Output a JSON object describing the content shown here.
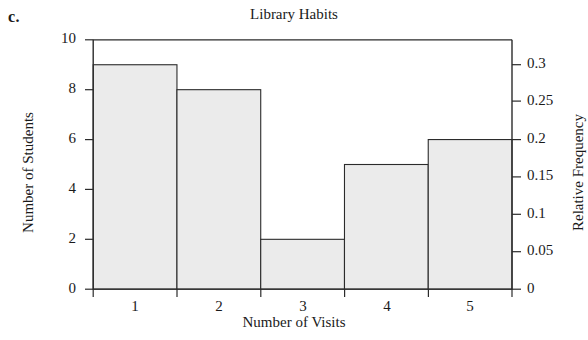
{
  "part_label": "c.",
  "chart_data": {
    "type": "bar",
    "title": "Library Habits",
    "xlabel": "Number of Visits",
    "ylabel": "Number of Students",
    "y2label": "Relative Frequency",
    "categories": [
      "1",
      "2",
      "3",
      "4",
      "5"
    ],
    "values": [
      9,
      8,
      2,
      5,
      6
    ],
    "relative_frequency": [
      0.3,
      0.2667,
      0.0667,
      0.1667,
      0.2
    ],
    "total": 30,
    "ylim": [
      0,
      10
    ],
    "yticks": [
      "0",
      "2",
      "4",
      "6",
      "8",
      "10"
    ],
    "ytick_values": [
      0,
      2,
      4,
      6,
      8,
      10
    ],
    "y2lim": [
      0,
      0.3333
    ],
    "y2ticks": [
      "0",
      "0.05",
      "0.1",
      "0.15",
      "0.2",
      "0.25",
      "0.3"
    ],
    "y2tick_values": [
      0,
      0.05,
      0.1,
      0.15,
      0.2,
      0.25,
      0.3
    ],
    "xticks": [
      "1",
      "2",
      "3",
      "4",
      "5"
    ],
    "bin_edges": [
      0.5,
      1.5,
      2.5,
      3.5,
      4.5,
      5.5
    ],
    "grid": false,
    "legend": "none",
    "bar_fill": "#ebebeb",
    "bar_stroke": "#2b2b2b",
    "axis_color": "#2b2b2b"
  }
}
